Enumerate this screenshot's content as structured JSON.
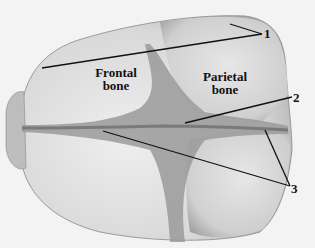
{
  "figure": {
    "bone_labels": [
      {
        "id": "frontal",
        "line1": "Frontal",
        "line2": "bone"
      },
      {
        "id": "parietal",
        "line1": "Parietal",
        "line2": "bone"
      }
    ],
    "callouts": [
      {
        "number": "1"
      },
      {
        "number": "2"
      },
      {
        "number": "3"
      }
    ]
  }
}
